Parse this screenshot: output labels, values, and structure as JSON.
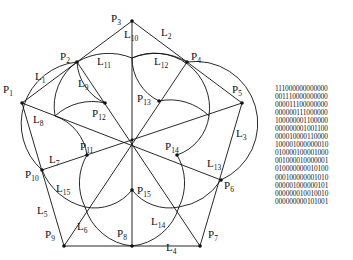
{
  "diagram": {
    "points": [
      {
        "id": "P1",
        "label": "P",
        "sub": "1",
        "x": 22,
        "y": 103,
        "lx": 3,
        "ly": 93
      },
      {
        "id": "P2",
        "label": "P",
        "sub": "2",
        "x": 77,
        "y": 62,
        "lx": 60,
        "ly": 60
      },
      {
        "id": "P3",
        "label": "P",
        "sub": "3",
        "x": 132,
        "y": 21,
        "lx": 111,
        "ly": 22
      },
      {
        "id": "P4",
        "label": "P",
        "sub": "4",
        "x": 187,
        "y": 62,
        "lx": 191,
        "ly": 60
      },
      {
        "id": "P5",
        "label": "P",
        "sub": "5",
        "x": 242,
        "y": 103,
        "lx": 232,
        "ly": 93
      },
      {
        "id": "P6",
        "label": "P",
        "sub": "6",
        "x": 221,
        "y": 180,
        "lx": 224,
        "ly": 189
      },
      {
        "id": "P7",
        "label": "P",
        "sub": "7",
        "x": 200,
        "y": 246,
        "lx": 208,
        "ly": 238
      },
      {
        "id": "P8",
        "label": "P",
        "sub": "8",
        "x": 132,
        "y": 246,
        "lx": 117,
        "ly": 237
      },
      {
        "id": "P9",
        "label": "P",
        "sub": "9",
        "x": 64,
        "y": 246,
        "lx": 45,
        "ly": 238
      },
      {
        "id": "P10",
        "label": "P",
        "sub": "10",
        "x": 42,
        "y": 170,
        "lx": 25,
        "ly": 178
      },
      {
        "id": "P11",
        "label": "P",
        "sub": "11",
        "x": 87,
        "y": 155,
        "lx": 80,
        "ly": 150
      },
      {
        "id": "P12",
        "label": "P",
        "sub": "12",
        "x": 105,
        "y": 103,
        "lx": 92,
        "ly": 117
      },
      {
        "id": "P13",
        "label": "P",
        "sub": "13",
        "x": 159,
        "y": 101,
        "lx": 137,
        "ly": 102
      },
      {
        "id": "P14",
        "label": "P",
        "sub": "14",
        "x": 177,
        "y": 155,
        "lx": 165,
        "ly": 150
      },
      {
        "id": "P15",
        "label": "P",
        "sub": "15",
        "x": 132,
        "y": 190,
        "lx": 137,
        "ly": 194
      }
    ],
    "lines": [
      {
        "id": "L1",
        "label": "L",
        "sub": "1",
        "from": "P1",
        "to": "P2",
        "lx": 35,
        "ly": 80
      },
      {
        "id": "L2",
        "label": "L",
        "sub": "2",
        "from": "P3",
        "to": "P4",
        "lx": 161,
        "ly": 36
      },
      {
        "id": "L3",
        "label": "L",
        "sub": "3",
        "from": "P5",
        "to": "P7",
        "lx": 236,
        "ly": 137
      },
      {
        "id": "L4",
        "label": "L",
        "sub": "4",
        "from": "P7",
        "to": "P9",
        "lx": 166,
        "ly": 251
      },
      {
        "id": "L5",
        "label": "L",
        "sub": "5",
        "from": "P9",
        "to": "P1",
        "lx": 37,
        "ly": 214
      },
      {
        "id": "L6",
        "label": "L",
        "sub": "6",
        "from": "P9",
        "to": "C",
        "lx": 77,
        "ly": 230
      },
      {
        "id": "L7",
        "label": "L",
        "sub": "7",
        "from": "P10",
        "to": "C",
        "lx": 49,
        "ly": 163
      },
      {
        "id": "L8",
        "label": "L",
        "sub": "8",
        "from": "P1",
        "to": "C",
        "lx": 33,
        "ly": 123
      },
      {
        "id": "L9",
        "label": "L",
        "sub": "9",
        "from": "P2",
        "to": "C",
        "lx": 78,
        "ly": 87
      },
      {
        "id": "L10",
        "label": "L",
        "sub": "10",
        "from": "P3",
        "to": "P8",
        "lx": 124,
        "ly": 38
      },
      {
        "id": "L11",
        "label": "L",
        "sub": "11",
        "from": "",
        "to": "",
        "lx": 97,
        "ly": 65
      },
      {
        "id": "L12",
        "label": "L",
        "sub": "12",
        "from": "P4",
        "to": "C",
        "lx": 154,
        "ly": 65
      },
      {
        "id": "L13",
        "label": "L",
        "sub": "13",
        "from": "P6",
        "to": "C",
        "lx": 207,
        "ly": 167
      },
      {
        "id": "L14",
        "label": "L",
        "sub": "14",
        "from": "P7",
        "to": "C",
        "lx": 151,
        "ly": 225
      },
      {
        "id": "L15",
        "label": "L",
        "sub": "15",
        "from": "",
        "to": "",
        "lx": 56,
        "ly": 192
      }
    ]
  },
  "matrix": {
    "rows": [
      "111000000000000",
      "001110000000000",
      "000011100000000",
      "000000111000000",
      "100000001100000",
      "000000001001100",
      "000010000110000",
      "100001000000010",
      "010000100001000",
      "001000010000001",
      "010000000010100",
      "000100000001010",
      "000001000000101",
      "000000010010010",
      "000000000101001"
    ]
  }
}
